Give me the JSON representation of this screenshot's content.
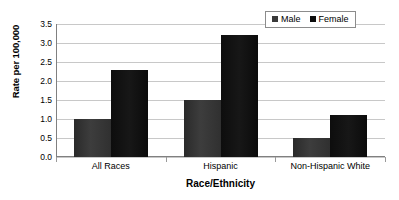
{
  "chart_data": {
    "type": "bar",
    "title": "",
    "xlabel": "Race/Ethnicity",
    "ylabel": "Rate per 100,000",
    "categories": [
      "All Races",
      "Hispanic",
      "Non-Hispanic White"
    ],
    "series": [
      {
        "name": "Male",
        "values": [
          1.0,
          1.5,
          0.5
        ],
        "color": "#3a3a3a"
      },
      {
        "name": "Female",
        "values": [
          2.3,
          3.2,
          1.1
        ],
        "color": "#0d0d0d"
      }
    ],
    "ylim": [
      0.0,
      3.5
    ],
    "ytick_labels": [
      "3.5",
      "3.0",
      "2.5",
      "2.0",
      "1.5",
      "1.0",
      "0.5",
      "0.0"
    ],
    "ytick_values": [
      3.5,
      3.0,
      2.5,
      2.0,
      1.5,
      1.0,
      0.5,
      0.0
    ],
    "grid": true,
    "legend_position": "top-right"
  },
  "legend": {
    "entries": [
      {
        "label": "Male",
        "swatch": "legend-swatch-male"
      },
      {
        "label": "Female",
        "swatch": "legend-swatch-female"
      }
    ]
  }
}
